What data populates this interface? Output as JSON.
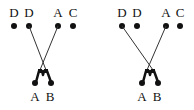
{
  "colors": {
    "ink": "#111111",
    "line": "#333333",
    "background": "#ffffff"
  },
  "diagrams": [
    {
      "top_labels": [
        "D",
        "D",
        "A",
        "C"
      ],
      "bottom_labels": [
        "A",
        "B"
      ],
      "connected_top_indices": [
        1,
        2
      ]
    },
    {
      "top_labels": [
        "D",
        "D",
        "A",
        "C"
      ],
      "bottom_labels": [
        "A",
        "B"
      ],
      "connected_top_indices": [
        0,
        2
      ]
    }
  ]
}
